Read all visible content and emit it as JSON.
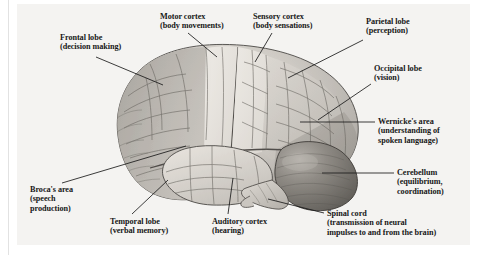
{
  "figure": {
    "view": "left lateral view, anterior to the left",
    "style": "grayscale anatomical engraving / halftone illustration",
    "panel_background": "#f4f3f1",
    "page_background": "#ffffff",
    "leader_line_color": "#1a1a1a",
    "text_color": "#171717"
  },
  "labels": [
    {
      "id": "frontal-lobe",
      "lines": [
        "Frontal lobe",
        "(decision making)"
      ],
      "x": 60,
      "y": 33,
      "align": "left"
    },
    {
      "id": "motor-cortex",
      "lines": [
        "Motor cortex",
        "(body movements)"
      ],
      "x": 160,
      "y": 12,
      "align": "left"
    },
    {
      "id": "sensory-cortex",
      "lines": [
        "Sensory cortex",
        "(body sensations)"
      ],
      "x": 253,
      "y": 12,
      "align": "left"
    },
    {
      "id": "parietal-lobe",
      "lines": [
        "Parietal lobe",
        "(perception)"
      ],
      "x": 366,
      "y": 17,
      "align": "left"
    },
    {
      "id": "occipital-lobe",
      "lines": [
        "Occipital lobe",
        "(vision)"
      ],
      "x": 374,
      "y": 64,
      "align": "left"
    },
    {
      "id": "wernickes-area",
      "lines": [
        "Wernicke's area",
        "(understanding of",
        "spoken language)"
      ],
      "x": 378,
      "y": 117,
      "align": "left"
    },
    {
      "id": "cerebellum",
      "lines": [
        "Cerebellum",
        "(equilibrium,",
        "coordination)"
      ],
      "x": 397,
      "y": 168,
      "align": "left"
    },
    {
      "id": "spinal-cord",
      "lines": [
        "Spinal cord",
        "(transmission of neural",
        "impulses to and from the brain)"
      ],
      "x": 327,
      "y": 209,
      "align": "left"
    },
    {
      "id": "auditory-cortex",
      "lines": [
        "Auditory cortex",
        "(hearing)"
      ],
      "x": 212,
      "y": 217,
      "align": "left"
    },
    {
      "id": "temporal-lobe",
      "lines": [
        "Temporal lobe",
        "(verbal memory)"
      ],
      "x": 110,
      "y": 217,
      "align": "left"
    },
    {
      "id": "brocas-area",
      "lines": [
        "Broca's area",
        "(speech",
        "production)"
      ],
      "x": 30,
      "y": 185,
      "align": "left"
    }
  ],
  "leader_lines": [
    {
      "id": "frontal-lobe-leader",
      "from": [
        96,
        57
      ],
      "to": [
        163,
        85
      ]
    },
    {
      "id": "motor-cortex-leader",
      "from": [
        188,
        33
      ],
      "to": [
        217,
        57
      ]
    },
    {
      "id": "sensory-cortex-leader",
      "from": [
        272,
        33
      ],
      "to": [
        255,
        62
      ]
    },
    {
      "id": "parietal-lobe-leader",
      "from": [
        363,
        40
      ],
      "to": [
        288,
        78
      ]
    },
    {
      "id": "occipital-lobe-leader",
      "from": [
        371,
        84
      ],
      "to": [
        318,
        120
      ]
    },
    {
      "id": "wernickes-area-leader",
      "from": [
        375,
        122
      ],
      "to": [
        300,
        122
      ]
    },
    {
      "id": "cerebellum-leader",
      "from": [
        394,
        173
      ],
      "to": [
        322,
        173
      ]
    },
    {
      "id": "spinal-cord-leader",
      "from": [
        324,
        213
      ],
      "to": [
        268,
        199
      ]
    },
    {
      "id": "auditory-cortex-leader",
      "from": [
        228,
        214
      ],
      "to": [
        233,
        178
      ]
    },
    {
      "id": "temporal-lobe-leader",
      "from": [
        132,
        214
      ],
      "to": [
        168,
        180
      ]
    },
    {
      "id": "brocas-area-leader",
      "from": [
        62,
        183
      ],
      "to": [
        186,
        146
      ]
    }
  ],
  "anatomy_regions": [
    {
      "id": "frontal-lobe-region",
      "name": "Frontal lobe",
      "shade": "#b9b6b1"
    },
    {
      "id": "motor-cortex-region",
      "name": "Motor cortex",
      "shade": "#ddd9d3"
    },
    {
      "id": "sensory-cortex-region",
      "name": "Sensory cortex",
      "shade": "#e4e0da"
    },
    {
      "id": "parietal-lobe-region",
      "name": "Parietal lobe",
      "shade": "#cdc9c3"
    },
    {
      "id": "occipital-lobe-region",
      "name": "Occipital lobe",
      "shade": "#b5b1ab"
    },
    {
      "id": "temporal-lobe-region",
      "name": "Temporal lobe",
      "shade": "#d6d2cb"
    },
    {
      "id": "cerebellum-region",
      "name": "Cerebellum",
      "shade": "#8a8680"
    },
    {
      "id": "brainstem-region",
      "name": "Brainstem / spinal cord",
      "shade": "#c6c2bb"
    }
  ]
}
